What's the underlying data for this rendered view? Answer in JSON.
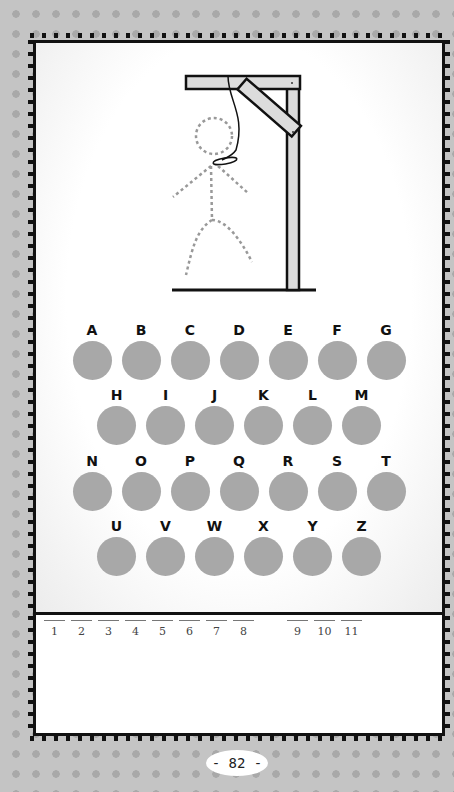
{
  "game": {
    "title": "Hangman",
    "page_number": "- 82 -",
    "colors": {
      "page_bg": "#c4c4c4",
      "dot": "#a9a9a9",
      "border": "#111111",
      "letter_circle": "#a8a8a8",
      "gallows_wood": "#dcdcdc"
    }
  },
  "keyboard": {
    "rows": [
      [
        "A",
        "B",
        "C",
        "D",
        "E",
        "F",
        "G"
      ],
      [
        "H",
        "I",
        "J",
        "K",
        "L",
        "M"
      ],
      [
        "N",
        "O",
        "P",
        "Q",
        "R",
        "S",
        "T"
      ],
      [
        "U",
        "V",
        "W",
        "X",
        "Y",
        "Z"
      ]
    ]
  },
  "answer": {
    "word1_slots": [
      "1",
      "2",
      "3",
      "4",
      "5",
      "6",
      "7",
      "8"
    ],
    "word2_slots": [
      "9",
      "10",
      "11"
    ]
  },
  "drawing": {
    "gallows": "gallows-icon",
    "figure": "dashed-stick-figure"
  }
}
